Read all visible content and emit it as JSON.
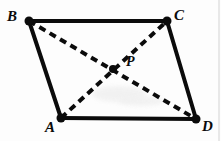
{
  "figure": {
    "type": "geometry-diagram",
    "width": 221,
    "height": 141,
    "background_color": "#fdfdfd",
    "stroke_color": "#0b0b0b",
    "solid_stroke_width": 4,
    "dashed_stroke_width": 4,
    "dash_pattern": "7 5",
    "vertex_dot_radius": 4
  },
  "points": {
    "B": {
      "label": "B",
      "x": 29,
      "y": 21,
      "label_x": 7,
      "label_y": 9
    },
    "C": {
      "label": "C",
      "x": 167,
      "y": 21,
      "label_x": 174,
      "label_y": 8
    },
    "A": {
      "label": "A",
      "x": 61,
      "y": 118,
      "label_x": 45,
      "label_y": 120
    },
    "D": {
      "label": "D",
      "x": 196,
      "y": 119,
      "label_x": 202,
      "label_y": 119
    },
    "P": {
      "label": "P",
      "x": 113,
      "y": 69,
      "label_x": 126,
      "label_y": 55
    }
  },
  "edges": [
    {
      "name": "edge-bc",
      "from": "B",
      "to": "C",
      "style": "solid"
    },
    {
      "name": "edge-ba",
      "from": "B",
      "to": "A",
      "style": "solid"
    },
    {
      "name": "edge-cd",
      "from": "C",
      "to": "D",
      "style": "solid"
    },
    {
      "name": "edge-ad",
      "from": "A",
      "to": "D",
      "style": "solid"
    }
  ],
  "diagonals": [
    {
      "name": "diagonal-bd",
      "from": "B",
      "to": "D",
      "style": "dashed"
    },
    {
      "name": "diagonal-ac",
      "from": "A",
      "to": "C",
      "style": "dashed"
    }
  ],
  "labels": {
    "b": "B",
    "c": "C",
    "a": "A",
    "d": "D",
    "p": "P"
  }
}
